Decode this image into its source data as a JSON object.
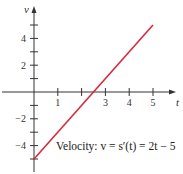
{
  "chart_data": {
    "type": "line",
    "title": "",
    "xlabel": "t",
    "ylabel": "v",
    "xlim": [
      0,
      5.9
    ],
    "ylim": [
      -6,
      6.5
    ],
    "x_ticks": [
      1,
      2,
      3,
      4,
      5
    ],
    "x_tick_labels": [
      "1",
      "",
      "3",
      "4",
      "5"
    ],
    "y_ticks": [
      -5,
      -4,
      -3,
      -2,
      -1,
      1,
      2,
      3,
      4,
      5
    ],
    "y_tick_labels": [
      "",
      "−4",
      "",
      "−2",
      "",
      "",
      "2",
      "",
      "4",
      ""
    ],
    "grid": false,
    "series": [
      {
        "name": "Velocity",
        "color": "#d42a3c",
        "x": [
          0,
          5
        ],
        "y": [
          -5,
          5
        ]
      }
    ],
    "annotation": "Velocity: v = s′(t) = 2t − 5"
  }
}
